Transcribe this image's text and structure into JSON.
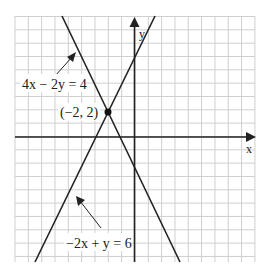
{
  "chart_data": {
    "type": "line",
    "title": "",
    "xlabel": "x",
    "ylabel": "y",
    "xlim": [
      -9,
      9
    ],
    "ylim": [
      -9.5,
      9
    ],
    "grid": true,
    "series": [
      {
        "name": "4x − 2y = 4",
        "points": [
          [
            -5.5,
            9
          ],
          [
            0,
            -2
          ],
          [
            3.4,
            -9.5
          ]
        ]
      },
      {
        "name": "−2x + y = 6",
        "points": [
          [
            -7.5,
            -9.5
          ],
          [
            -3,
            0
          ],
          [
            0,
            6
          ],
          [
            1.5,
            9
          ]
        ]
      }
    ],
    "annotations": [
      {
        "text": "4x − 2y = 4",
        "arrow_to": [
          -4.8,
          7.3
        ]
      },
      {
        "text": "−2x + y = 6",
        "arrow_to": [
          -4.3,
          -4.5
        ]
      },
      {
        "text": "(−2, 2)",
        "point": [
          -2,
          2
        ]
      }
    ]
  },
  "labels": {
    "x_axis": "x",
    "y_axis": "y",
    "line1": "4x − 2y = 4",
    "line2": "−2x + y = 6",
    "point": "(−2, 2)"
  }
}
